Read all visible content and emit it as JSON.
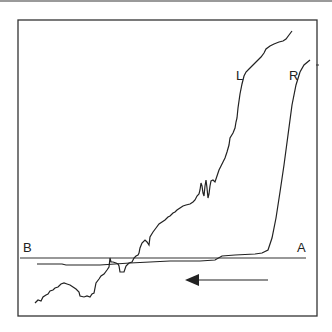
{
  "diagram": {
    "labels": {
      "trace_left": "L",
      "trace_right": "R",
      "baseline_left": "B",
      "baseline_right": "A"
    },
    "arrow": {
      "direction": "left"
    },
    "colors": {
      "stroke": "#222222",
      "frame": "#333333",
      "background": "#ffffff"
    }
  }
}
